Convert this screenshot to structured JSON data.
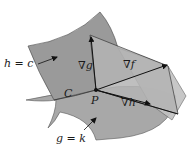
{
  "figure": {
    "type": "lagrange-multipliers-two-constraints",
    "colors": {
      "background": "#ffffff",
      "surface_h": "#9a9a9a",
      "surface_g": "#a8a8a8",
      "tangent_plane": "#b4b4b4",
      "tangent_plane_back": "#c2c2c2",
      "edge": "#3a3a3a",
      "arrow": "#111111"
    },
    "labels": {
      "surface_h": "h = c",
      "surface_g": "g = k",
      "curve": "C",
      "point": "P",
      "grad_f": "∇f",
      "grad_g": "∇g",
      "grad_h": "∇h"
    },
    "point_P": [
      96,
      90
    ]
  }
}
